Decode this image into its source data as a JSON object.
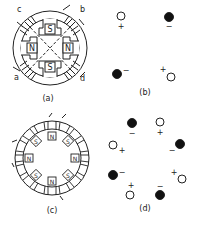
{
  "figures": {
    "a": {
      "caption": "(a)",
      "description": "Two-phase stator with four salient poles and windings",
      "pole_labels": {
        "top": "S",
        "bottom": "S",
        "left": "N",
        "right": "N"
      },
      "winding_labels": {
        "top_left": "c",
        "top_right": "b",
        "bottom_left": "a",
        "bottom_right": "d"
      }
    },
    "b": {
      "caption": "(b)",
      "description": "Conductor current directions for (a)",
      "conductors": [
        {
          "position": "top-left",
          "type": "open",
          "sign": "+"
        },
        {
          "position": "top-right",
          "type": "filled",
          "sign": "−"
        },
        {
          "position": "bottom-left",
          "type": "filled",
          "sign": "−"
        },
        {
          "position": "bottom-right",
          "type": "open",
          "sign": "+"
        }
      ]
    },
    "c": {
      "caption": "(c)",
      "description": "Stator with eight salient poles and windings",
      "pole_labels": [
        "N",
        "S",
        "N",
        "S",
        "N",
        "S",
        "N",
        "S"
      ]
    },
    "d": {
      "caption": "(d)",
      "description": "Conductor current directions for (c)",
      "conductors": [
        {
          "position": "top-1",
          "type": "filled",
          "sign": "−"
        },
        {
          "position": "top-2",
          "type": "open",
          "sign": "+"
        },
        {
          "position": "right-1",
          "type": "filled",
          "sign": "−"
        },
        {
          "position": "right-2",
          "type": "open",
          "sign": "+"
        },
        {
          "position": "bottom-1",
          "type": "filled",
          "sign": "−"
        },
        {
          "position": "bottom-2",
          "type": "open",
          "sign": "+"
        },
        {
          "position": "left-1",
          "type": "filled",
          "sign": "−"
        },
        {
          "position": "left-2",
          "type": "open",
          "sign": "+"
        }
      ]
    }
  }
}
